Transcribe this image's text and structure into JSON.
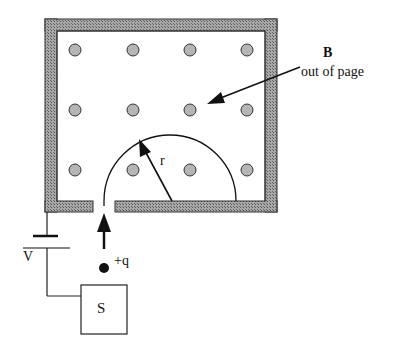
{
  "diagram": {
    "colors": {
      "wall_fill": "#8c8c8c",
      "wall_stroke": "#333333",
      "dot_fill": "#b5b5b5",
      "dot_stroke": "#333333",
      "line": "#111111",
      "background": "#ffffff"
    },
    "field": {
      "symbol": "B",
      "direction_label": "out of page",
      "dot_rows": 3,
      "dot_cols": 4,
      "dot_x": [
        75,
        133,
        190,
        247
      ],
      "dot_y": [
        50,
        110,
        170
      ]
    },
    "path": {
      "shape": "semicircle",
      "radius_label": "r"
    },
    "circuit": {
      "voltage_label": "V",
      "source_label": "S",
      "particle_label": "+q"
    }
  }
}
